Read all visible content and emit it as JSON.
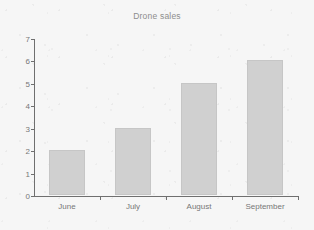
{
  "chart_data": {
    "type": "bar",
    "title": "Drone sales",
    "xlabel": "",
    "ylabel": "",
    "categories": [
      "June",
      "July",
      "August",
      "September"
    ],
    "values": [
      2,
      3,
      5,
      6
    ],
    "ylim": [
      0,
      7
    ],
    "yticks": [
      0,
      1,
      2,
      3,
      4,
      5,
      6,
      7
    ],
    "ytick_labels": [
      "0",
      "1",
      "2",
      "3",
      "4",
      "5",
      "6",
      "7"
    ],
    "grid": false,
    "legend": null,
    "legend_position": "none"
  },
  "style": {
    "background_color": "#f6f6f6",
    "bar_color": "#d0d0d0",
    "bar_edge_color": "#c6c6c6",
    "axis_color": "#6f6f6f",
    "title_color": "#8d8d8d",
    "tick_label_color": "#767676"
  }
}
